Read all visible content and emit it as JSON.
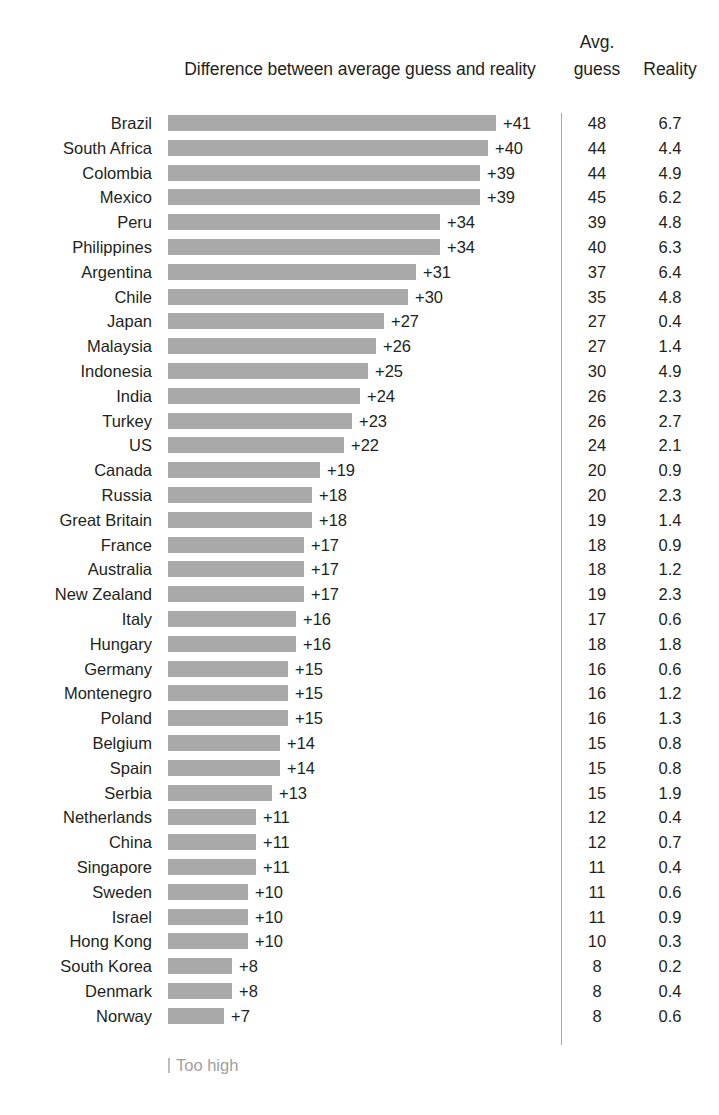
{
  "chart_data": {
    "type": "bar",
    "title": "Difference between average guess and reality",
    "xlabel": "",
    "ylabel": "",
    "orientation": "horizontal",
    "grid": false,
    "legend_position": "bottom-left",
    "legend_entries": [
      "Too high"
    ],
    "columns": [
      "Difference between average guess and reality",
      "Avg. guess",
      "Reality"
    ],
    "value_prefix": "+",
    "xlim": [
      0,
      41
    ],
    "categories": [
      "Brazil",
      "South Africa",
      "Colombia",
      "Mexico",
      "Peru",
      "Philippines",
      "Argentina",
      "Chile",
      "Japan",
      "Malaysia",
      "Indonesia",
      "India",
      "Turkey",
      "US",
      "Canada",
      "Russia",
      "Great Britain",
      "France",
      "Australia",
      "New Zealand",
      "Italy",
      "Hungary",
      "Germany",
      "Montenegro",
      "Poland",
      "Belgium",
      "Spain",
      "Serbia",
      "Netherlands",
      "China",
      "Singapore",
      "Sweden",
      "Israel",
      "Hong Kong",
      "South Korea",
      "Denmark",
      "Norway"
    ],
    "values": [
      41,
      40,
      39,
      39,
      34,
      34,
      31,
      30,
      27,
      26,
      25,
      24,
      23,
      22,
      19,
      18,
      18,
      17,
      17,
      17,
      16,
      16,
      15,
      15,
      15,
      14,
      14,
      13,
      11,
      11,
      11,
      10,
      10,
      10,
      8,
      8,
      7
    ],
    "series": [
      {
        "name": "Difference",
        "values": [
          41,
          40,
          39,
          39,
          34,
          34,
          31,
          30,
          27,
          26,
          25,
          24,
          23,
          22,
          19,
          18,
          18,
          17,
          17,
          17,
          16,
          16,
          15,
          15,
          15,
          14,
          14,
          13,
          11,
          11,
          11,
          10,
          10,
          10,
          8,
          8,
          7
        ]
      },
      {
        "name": "Avg. guess",
        "values": [
          48,
          44,
          44,
          45,
          39,
          40,
          37,
          35,
          27,
          27,
          30,
          26,
          26,
          24,
          20,
          20,
          19,
          18,
          18,
          19,
          17,
          18,
          16,
          16,
          16,
          15,
          15,
          15,
          12,
          12,
          11,
          11,
          11,
          10,
          8,
          8,
          8
        ]
      },
      {
        "name": "Reality",
        "values": [
          6.7,
          4.4,
          4.9,
          6.2,
          4.8,
          6.3,
          6.4,
          4.8,
          0.4,
          1.4,
          4.9,
          2.3,
          2.7,
          2.1,
          0.9,
          2.3,
          1.4,
          0.9,
          1.2,
          2.3,
          0.6,
          1.8,
          0.6,
          1.2,
          1.3,
          0.8,
          0.8,
          1.9,
          0.4,
          0.7,
          0.4,
          0.6,
          0.9,
          0.3,
          0.2,
          0.4,
          0.6
        ]
      }
    ]
  },
  "header": {
    "title": "Difference between average guess and reality",
    "avg_line1": "Avg.",
    "avg_line2": "guess",
    "reality": "Reality"
  },
  "footer": {
    "legend_label": "Too high"
  },
  "style": {
    "bar_color": "#a9a9a9",
    "text_color": "#231f20",
    "legend_color": "#a0a0a0",
    "divider_color": "#a9a9a9",
    "background": "#ffffff"
  },
  "rows": [
    {
      "country": "Brazil",
      "diff": "+41",
      "avg": "48",
      "reality": "6.7",
      "v": 41
    },
    {
      "country": "South Africa",
      "diff": "+40",
      "avg": "44",
      "reality": "4.4",
      "v": 40
    },
    {
      "country": "Colombia",
      "diff": "+39",
      "avg": "44",
      "reality": "4.9",
      "v": 39
    },
    {
      "country": "Mexico",
      "diff": "+39",
      "avg": "45",
      "reality": "6.2",
      "v": 39
    },
    {
      "country": "Peru",
      "diff": "+34",
      "avg": "39",
      "reality": "4.8",
      "v": 34
    },
    {
      "country": "Philippines",
      "diff": "+34",
      "avg": "40",
      "reality": "6.3",
      "v": 34
    },
    {
      "country": "Argentina",
      "diff": "+31",
      "avg": "37",
      "reality": "6.4",
      "v": 31
    },
    {
      "country": "Chile",
      "diff": "+30",
      "avg": "35",
      "reality": "4.8",
      "v": 30
    },
    {
      "country": "Japan",
      "diff": "+27",
      "avg": "27",
      "reality": "0.4",
      "v": 27
    },
    {
      "country": "Malaysia",
      "diff": "+26",
      "avg": "27",
      "reality": "1.4",
      "v": 26
    },
    {
      "country": "Indonesia",
      "diff": "+25",
      "avg": "30",
      "reality": "4.9",
      "v": 25
    },
    {
      "country": "India",
      "diff": "+24",
      "avg": "26",
      "reality": "2.3",
      "v": 24
    },
    {
      "country": "Turkey",
      "diff": "+23",
      "avg": "26",
      "reality": "2.7",
      "v": 23
    },
    {
      "country": "US",
      "diff": "+22",
      "avg": "24",
      "reality": "2.1",
      "v": 22
    },
    {
      "country": "Canada",
      "diff": "+19",
      "avg": "20",
      "reality": "0.9",
      "v": 19
    },
    {
      "country": "Russia",
      "diff": "+18",
      "avg": "20",
      "reality": "2.3",
      "v": 18
    },
    {
      "country": "Great Britain",
      "diff": "+18",
      "avg": "19",
      "reality": "1.4",
      "v": 18
    },
    {
      "country": "France",
      "diff": "+17",
      "avg": "18",
      "reality": "0.9",
      "v": 17
    },
    {
      "country": "Australia",
      "diff": "+17",
      "avg": "18",
      "reality": "1.2",
      "v": 17
    },
    {
      "country": "New Zealand",
      "diff": "+17",
      "avg": "19",
      "reality": "2.3",
      "v": 17
    },
    {
      "country": "Italy",
      "diff": "+16",
      "avg": "17",
      "reality": "0.6",
      "v": 16
    },
    {
      "country": "Hungary",
      "diff": "+16",
      "avg": "18",
      "reality": "1.8",
      "v": 16
    },
    {
      "country": "Germany",
      "diff": "+15",
      "avg": "16",
      "reality": "0.6",
      "v": 15
    },
    {
      "country": "Montenegro",
      "diff": "+15",
      "avg": "16",
      "reality": "1.2",
      "v": 15
    },
    {
      "country": "Poland",
      "diff": "+15",
      "avg": "16",
      "reality": "1.3",
      "v": 15
    },
    {
      "country": "Belgium",
      "diff": "+14",
      "avg": "15",
      "reality": "0.8",
      "v": 14
    },
    {
      "country": "Spain",
      "diff": "+14",
      "avg": "15",
      "reality": "0.8",
      "v": 14
    },
    {
      "country": "Serbia",
      "diff": "+13",
      "avg": "15",
      "reality": "1.9",
      "v": 13
    },
    {
      "country": "Netherlands",
      "diff": "+11",
      "avg": "12",
      "reality": "0.4",
      "v": 11
    },
    {
      "country": "China",
      "diff": "+11",
      "avg": "12",
      "reality": "0.7",
      "v": 11
    },
    {
      "country": "Singapore",
      "diff": "+11",
      "avg": "11",
      "reality": "0.4",
      "v": 11
    },
    {
      "country": "Sweden",
      "diff": "+10",
      "avg": "11",
      "reality": "0.6",
      "v": 10
    },
    {
      "country": "Israel",
      "diff": "+10",
      "avg": "11",
      "reality": "0.9",
      "v": 10
    },
    {
      "country": "Hong Kong",
      "diff": "+10",
      "avg": "10",
      "reality": "0.3",
      "v": 10
    },
    {
      "country": "South Korea",
      "diff": "+8",
      "avg": "8",
      "reality": "0.2",
      "v": 8
    },
    {
      "country": "Denmark",
      "diff": "+8",
      "avg": "8",
      "reality": "0.4",
      "v": 8
    },
    {
      "country": "Norway",
      "diff": "+7",
      "avg": "8",
      "reality": "0.6",
      "v": 7
    }
  ]
}
